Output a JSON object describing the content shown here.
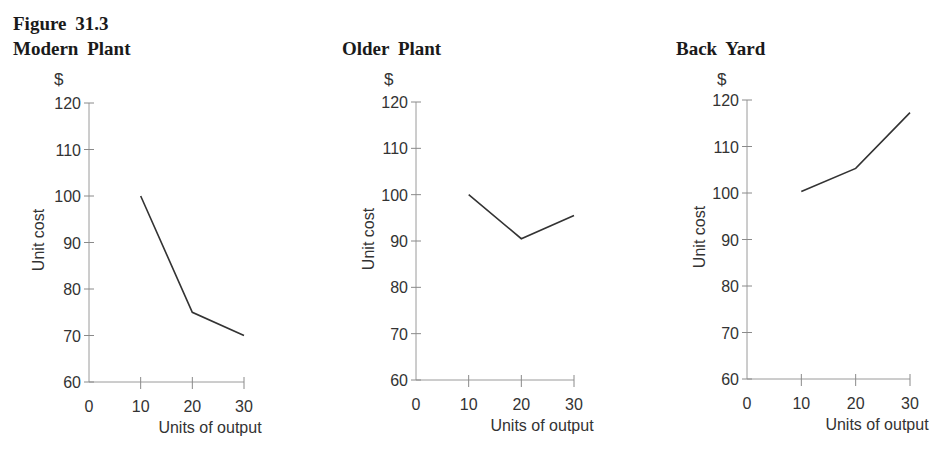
{
  "figure": {
    "label": "Figure 31.3"
  },
  "panels": [
    {
      "title": "Modern Plant",
      "unit": "$",
      "ylabel": "Unit cost",
      "xlabel": "Units of output"
    },
    {
      "title": "Older Plant",
      "unit": "$",
      "ylabel": "Unit cost",
      "xlabel": "Units of output"
    },
    {
      "title": "Back Yard",
      "unit": "$",
      "ylabel": "Unit cost",
      "xlabel": "Units of output"
    }
  ],
  "chart_data": [
    {
      "type": "line",
      "title": "Modern Plant",
      "xlabel": "Units of output",
      "ylabel": "Unit cost",
      "unit": "$",
      "x": [
        10,
        20,
        30
      ],
      "values": [
        100,
        75,
        70
      ],
      "xticks": [
        0,
        10,
        20,
        30
      ],
      "yticks": [
        60,
        70,
        80,
        90,
        100,
        110,
        120
      ],
      "xlim": [
        0,
        30
      ],
      "ylim": [
        60,
        120
      ],
      "grid": false,
      "legend": null
    },
    {
      "type": "line",
      "title": "Older Plant",
      "xlabel": "Units of output",
      "ylabel": "Unit cost",
      "unit": "$",
      "x": [
        10,
        20,
        30
      ],
      "values": [
        100,
        90.5,
        95.5
      ],
      "xticks": [
        0,
        10,
        20,
        30
      ],
      "yticks": [
        60,
        70,
        80,
        90,
        100,
        110,
        120
      ],
      "xlim": [
        0,
        30
      ],
      "ylim": [
        60,
        120
      ],
      "grid": false,
      "legend": null
    },
    {
      "type": "line",
      "title": "Back Yard",
      "xlabel": "Units of output",
      "ylabel": "Unit cost",
      "unit": "$",
      "x": [
        10,
        20,
        30
      ],
      "values": [
        100.3,
        105.3,
        117.3
      ],
      "xticks": [
        0,
        10,
        20,
        30
      ],
      "yticks": [
        60,
        70,
        80,
        90,
        100,
        110,
        120
      ],
      "xlim": [
        0,
        30
      ],
      "ylim": [
        60,
        120
      ],
      "grid": false,
      "legend": null
    }
  ]
}
